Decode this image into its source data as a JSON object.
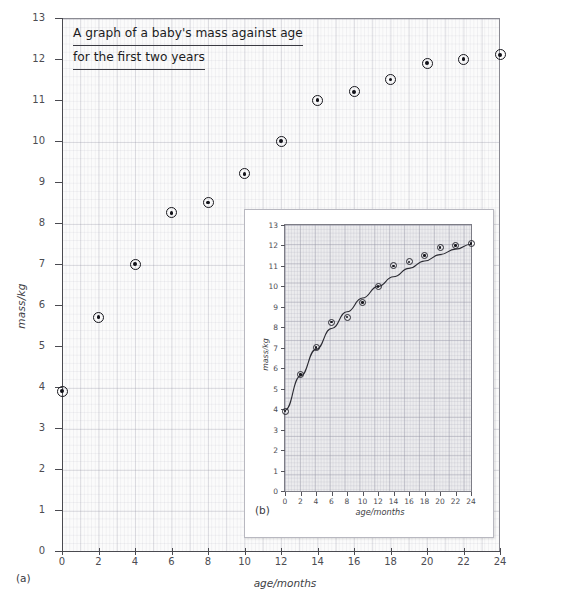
{
  "figure": {
    "panel_a_label": "(a)",
    "panel_b_label": "(b)"
  },
  "main": {
    "title_line1": "A graph of a baby's mass against age",
    "title_line2": "for the first two years",
    "xlabel": "age/months",
    "ylabel": "mass/kg",
    "xticks": [
      "0",
      "2",
      "4",
      "6",
      "8",
      "10",
      "12",
      "14",
      "16",
      "18",
      "20",
      "22",
      "24"
    ],
    "yticks": [
      "0",
      "1",
      "2",
      "3",
      "4",
      "5",
      "6",
      "7",
      "8",
      "9",
      "10",
      "11",
      "12",
      "13"
    ]
  },
  "inset": {
    "xlabel": "age/months",
    "ylabel": "mass/kg",
    "xticks": [
      "0",
      "2",
      "4",
      "6",
      "8",
      "10",
      "12",
      "14",
      "16",
      "18",
      "20",
      "22",
      "24"
    ],
    "yticks": [
      "0",
      "1",
      "2",
      "3",
      "4",
      "5",
      "6",
      "7",
      "8",
      "9",
      "10",
      "11",
      "12",
      "13"
    ]
  },
  "colors": {
    "marker": "#15151b",
    "grid_major": "#9696a5",
    "grid_minor": "#a5a5b4",
    "axis": "#4a4a50",
    "inset_plot_bg": "#ececee",
    "main_plot_bg": "#fbfbfb",
    "curve": "#2a2a32"
  },
  "chart_data": [
    {
      "id": "panel-a",
      "type": "scatter",
      "title": "A graph of a baby's mass against age for the first two years",
      "xlabel": "age/months",
      "ylabel": "mass/kg",
      "xlim": [
        0,
        24
      ],
      "ylim": [
        0,
        13
      ],
      "xtick_step": 2,
      "ytick_step": 1,
      "grid": true,
      "legend": "none",
      "x": [
        0,
        2,
        4,
        6,
        8,
        10,
        12,
        14,
        16,
        18,
        20,
        22,
        24
      ],
      "y": [
        3.9,
        5.7,
        7.0,
        8.25,
        8.5,
        9.2,
        10.0,
        11.0,
        11.2,
        11.5,
        11.9,
        12.0,
        12.1
      ],
      "series": [
        {
          "name": "baby mass",
          "marker": "circle-with-dot",
          "values": [
            3.9,
            5.7,
            7.0,
            8.25,
            8.5,
            9.2,
            10.0,
            11.0,
            11.2,
            11.5,
            11.9,
            12.0,
            12.1
          ]
        }
      ]
    },
    {
      "id": "panel-b",
      "type": "scatter",
      "title": "",
      "xlabel": "age/months",
      "ylabel": "mass/kg",
      "xlim": [
        0,
        24
      ],
      "ylim": [
        0,
        13
      ],
      "xtick_step": 2,
      "ytick_step": 1,
      "grid": true,
      "legend": "none",
      "has_fitted_curve": true,
      "x": [
        0,
        2,
        4,
        6,
        8,
        10,
        12,
        14,
        16,
        18,
        20,
        22,
        24
      ],
      "y": [
        3.9,
        5.7,
        7.0,
        8.25,
        8.5,
        9.2,
        10.0,
        11.0,
        11.2,
        11.5,
        11.9,
        12.0,
        12.1
      ],
      "series": [
        {
          "name": "baby mass",
          "marker": "circle-with-dot",
          "values": [
            3.9,
            5.7,
            7.0,
            8.25,
            8.5,
            9.2,
            10.0,
            11.0,
            11.2,
            11.5,
            11.9,
            12.0,
            12.1
          ]
        },
        {
          "name": "best-fit curve",
          "type": "line",
          "values": [
            3.95,
            5.62,
            6.92,
            7.94,
            8.76,
            9.43,
            10.0,
            10.47,
            10.88,
            11.24,
            11.55,
            11.82,
            12.06
          ]
        }
      ]
    }
  ]
}
